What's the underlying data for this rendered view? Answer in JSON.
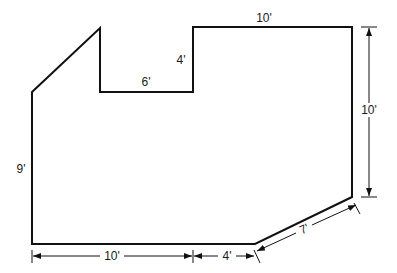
{
  "diagram": {
    "type": "floor-plan",
    "outline_color": "#111111",
    "background": "#ffffff",
    "outline_points": [
      [
        32,
        92
      ],
      [
        100,
        28
      ],
      [
        100,
        92
      ],
      [
        193,
        92
      ],
      [
        193,
        27
      ],
      [
        352,
        27
      ],
      [
        352,
        197
      ],
      [
        255,
        244
      ],
      [
        32,
        244
      ]
    ],
    "labels": {
      "top_right_width": "10'",
      "notch_depth": "4'",
      "notch_width": "6'",
      "left_height": "9'",
      "right_height": "10'",
      "bottom_left_width": "10'",
      "bottom_mid_width": "4'",
      "diagonal_length": "7'"
    }
  }
}
